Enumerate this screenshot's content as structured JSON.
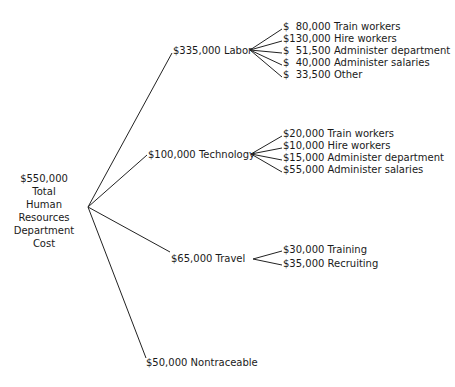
{
  "root": {
    "lines": [
      "$550,000",
      "Total",
      "Human",
      "Resources",
      "Department",
      "Cost"
    ]
  },
  "branches": [
    {
      "label": "$335,000 Labor",
      "children": [
        "$  80,000 Train workers",
        "$130,000 Hire workers",
        "$  51,500 Administer department",
        "$  40,000 Administer salaries",
        "$  33,500 Other"
      ]
    },
    {
      "label": "$100,000 Technology",
      "children": [
        "$20,000 Train workers",
        "$10,000 Hire workers",
        "$15,000 Administer department",
        "$55,000 Administer salaries"
      ]
    },
    {
      "label": "$65,000 Travel",
      "children": [
        "$30,000 Training",
        "$35,000 Recruiting"
      ]
    },
    {
      "label": "$50,000 Nontraceable",
      "children": []
    }
  ]
}
